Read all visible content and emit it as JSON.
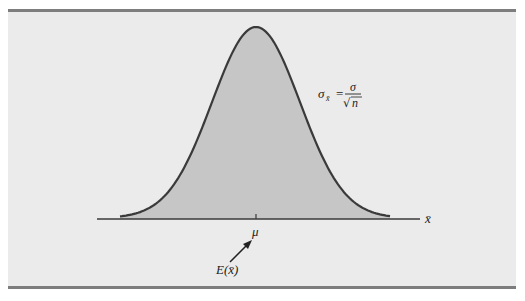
{
  "figure": {
    "type": "sampling-distribution-diagram",
    "colors": {
      "background": "#ebebeb",
      "border": "#7d7d7d",
      "curve_fill": "#c6c6c6",
      "curve_stroke": "#3a3a3a",
      "axis": "#3a3a3a",
      "text": "#222222"
    },
    "formula": {
      "lhs": "σ",
      "lhs_subscript": "x̄",
      "equals": "=",
      "numerator": "σ",
      "denominator_radical": "√",
      "denominator_var": "n"
    },
    "axis_label": "x̄",
    "mean_label": "μ",
    "expectation_label": "E(x̄)"
  },
  "chart_data": {
    "type": "area",
    "title": "",
    "xlabel": "x̄",
    "ylabel": "",
    "annotations": [
      "σ_x̄ = σ/√n",
      "μ",
      "E(x̄)"
    ],
    "center_label": "μ",
    "grid": false,
    "legend": "none"
  }
}
